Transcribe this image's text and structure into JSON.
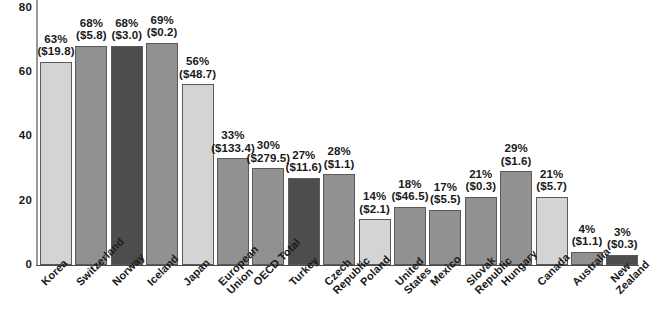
{
  "chart_data": {
    "type": "bar",
    "title": "",
    "subtitle": "",
    "xlabel": "",
    "ylabel": "",
    "ylim": [
      0,
      80
    ],
    "yticks": [
      0,
      20,
      40,
      60,
      80
    ],
    "grid": false,
    "legend": "none",
    "categories": [
      "Korea",
      "Switzerland",
      "Norway",
      "Iceland",
      "Japan",
      "European Union",
      "OECD Total",
      "Turkey",
      "Czech Republic",
      "Poland",
      "United States",
      "Mexico",
      "Slovak Republic",
      "Hungary",
      "Canada",
      "Australia",
      "New Zealand"
    ],
    "values": [
      63,
      68,
      68,
      69,
      56,
      33,
      30,
      27,
      28,
      14,
      18,
      17,
      21,
      29,
      21,
      4,
      3
    ],
    "value_labels": [
      "63%",
      "68%",
      "68%",
      "69%",
      "56%",
      "33%",
      "30%",
      "27%",
      "28%",
      "14%",
      "18%",
      "17%",
      "21%",
      "29%",
      "21%",
      "4%",
      "3%"
    ],
    "amount_labels": [
      "($19.8)",
      "($5.8)",
      "($3.0)",
      "($0.2)",
      "($48.7)",
      "($133.4)",
      "($279.5)",
      "($11.6)",
      "($1.1)",
      "($2.1)",
      "($46.5)",
      "($5.5)",
      "($0.3)",
      "($1.6)",
      "($5.7)",
      "($1.1)",
      "($0.3)"
    ],
    "bar_shades": [
      "light",
      "medium",
      "dark",
      "medium",
      "light",
      "medium",
      "medium",
      "dark",
      "medium",
      "light",
      "medium",
      "medium",
      "medium",
      "medium",
      "light",
      "medium",
      "dark"
    ]
  },
  "colors": {
    "light": "#d4d4d4",
    "medium": "#919191",
    "dark": "#4d4d4d",
    "bar_border": "#5a5a5a",
    "axis": "#4a4a4a",
    "text": "#1a1a1a",
    "background": "#ffffff"
  },
  "x_label_lines": [
    [
      "Korea"
    ],
    [
      "Switzerland"
    ],
    [
      "Norway"
    ],
    [
      "Iceland"
    ],
    [
      "Japan"
    ],
    [
      "European",
      "Union"
    ],
    [
      "OECD Total"
    ],
    [
      "Turkey"
    ],
    [
      "Czech",
      "Republic"
    ],
    [
      "Poland"
    ],
    [
      "United",
      "States"
    ],
    [
      "Mexico"
    ],
    [
      "Slovak",
      "Republic"
    ],
    [
      "Hungary"
    ],
    [
      "Canada"
    ],
    [
      "Australia"
    ],
    [
      "New",
      "Zealand"
    ]
  ]
}
